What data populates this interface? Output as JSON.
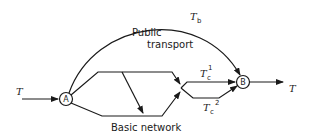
{
  "diagram": {
    "nodes": [
      {
        "id": "A",
        "label": "A"
      },
      {
        "id": "B",
        "label": "B"
      }
    ],
    "labels": {
      "input_flow": "T",
      "output_flow": "T",
      "public_transport_line1": "Public",
      "public_transport_line2": "transport",
      "basic_network": "Basic network",
      "tb_main": "T",
      "tb_sub": "b",
      "tc1_main": "T",
      "tc1_sub": "c",
      "tc1_sup": "1",
      "tc2_main": "T",
      "tc2_sub": "c",
      "tc2_sup": "2"
    },
    "colors": {
      "stroke": "#1a1a1a",
      "background": "#ffffff"
    }
  }
}
